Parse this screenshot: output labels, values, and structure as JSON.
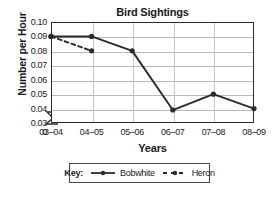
{
  "chart_data": {
    "type": "line",
    "title": "Bird Sightings",
    "xlabel": "Years",
    "ylabel": "Number per Hour",
    "categories": [
      "03–04",
      "04–05",
      "05–06",
      "06–07",
      "07–08",
      "08–09"
    ],
    "ylim": [
      0.03,
      0.1
    ],
    "yticks": [
      "0.10",
      "0.09",
      "0.08",
      "0.07",
      "0.06",
      "0.05",
      "0.04",
      "0.03",
      "0"
    ],
    "ytick_values": [
      0.1,
      0.09,
      0.08,
      0.07,
      0.06,
      0.05,
      0.04,
      0.03,
      0
    ],
    "axis_break": true,
    "axis_break_note": "y-axis broken between 0 and 0.03",
    "grid": true,
    "grid_orientation": "both",
    "legend_position": "below-plot",
    "legend_title": "Key:",
    "series": [
      {
        "name": "Bobwhite",
        "line_style": "solid",
        "marker": "circle",
        "color": "#2b2b2b",
        "values": [
          0.09,
          0.09,
          0.08,
          0.039,
          0.05,
          0.04
        ]
      },
      {
        "name": "Heron",
        "line_style": "dashed",
        "marker": "circle",
        "color": "#2b2b2b",
        "values": [
          0.09,
          0.08,
          null,
          null,
          null,
          null
        ]
      }
    ]
  },
  "legend": {
    "title": "Key:",
    "entries": [
      {
        "label": "Bobwhite",
        "style": "solid"
      },
      {
        "label": "Heron",
        "style": "dashed"
      }
    ]
  }
}
